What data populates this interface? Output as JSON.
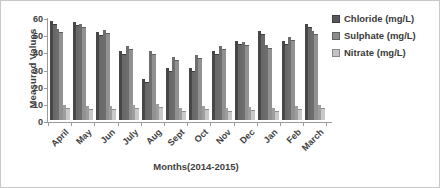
{
  "chart_data": {
    "type": "bar",
    "title": "",
    "xlabel": "Months(2014-2015)",
    "ylabel": "Measured Values",
    "categories": [
      "April",
      "May",
      "Jun",
      "July",
      "Aug",
      "Sept",
      "Oct",
      "Nov",
      "Dec",
      "Jan",
      "Feb",
      "March"
    ],
    "series": [
      {
        "name": "Chloride (mg/L)",
        "values": [
          56,
          55.5,
          49.5,
          38.5,
          22,
          28.5,
          28.5,
          38.5,
          44.5,
          50,
          44.5,
          54
        ]
      },
      {
        "name": "Sulphate (mg/L)",
        "values": [
          51.5,
          54,
          50.5,
          41.5,
          38.5,
          35,
          36,
          41.5,
          43.5,
          42,
          46.5,
          50
        ]
      },
      {
        "name": "Nitrate (mg/L)",
        "values": [
          7,
          6.5,
          6.5,
          7,
          7.5,
          5.5,
          6.5,
          5.5,
          6,
          5,
          6.5,
          7
        ]
      }
    ],
    "ylim": [
      0,
      60
    ],
    "yticks": [
      0,
      10,
      20,
      30,
      40,
      50,
      60
    ],
    "grid": false,
    "style_3d": true,
    "legend": {
      "position": "right",
      "entries": [
        {
          "label": "Chloride (mg/L)",
          "color": "#595959"
        },
        {
          "label": "Sulphate (mg/L)",
          "color": "#8c8c8c"
        },
        {
          "label": "Nitrate (mg/L)",
          "color": "#c3c3c3"
        }
      ]
    },
    "bar_colors": {
      "front": [
        "#696969",
        "#919191",
        "#c9c9c9"
      ],
      "side": [
        "#474747",
        "#6d6d6d",
        "#9e9e9e"
      ],
      "top_edge": [
        "#3d3d3d",
        "#5f5f5f",
        "#8f8f8f"
      ]
    }
  }
}
